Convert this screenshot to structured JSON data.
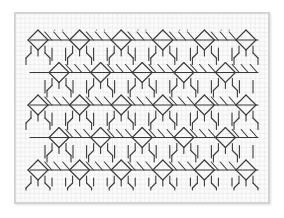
{
  "figure": {
    "colors": {
      "background": "#ffffff",
      "paper": "#fbfbfb",
      "frame": "#d2d2d2",
      "grid": "#e4e4e4",
      "stitch": "#3a3a3a"
    },
    "grid": {
      "cell": 4.6,
      "x0": 16,
      "y0": 14,
      "x1": 268,
      "y1": 202
    },
    "pattern": {
      "period": 41.6,
      "diamond_half": 10,
      "rows": [
        {
          "y": 40,
          "first_x": 38
        },
        {
          "y": 72.5,
          "first_x": 59
        },
        {
          "y": 105,
          "first_x": 38
        },
        {
          "y": 137.5,
          "first_x": 59
        },
        {
          "y": 170,
          "first_x": 38
        }
      ],
      "x_min": 30,
      "x_max": 258,
      "bottom_ticks_end": 190,
      "top_ticks_start": 26
    }
  }
}
